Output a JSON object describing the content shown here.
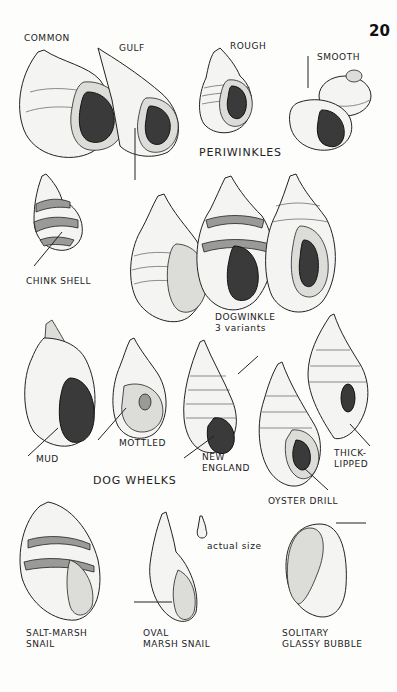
{
  "page": {
    "number": "20",
    "groups": {
      "periwinkles": "PERIWINKLES",
      "dogwinkle": "DOGWINKLE",
      "dogwinkle_note": "3 variants",
      "dog_whelks": "DOG WHELKS"
    },
    "labels": {
      "common": "COMMON",
      "gulf": "GULF",
      "rough": "ROUGH",
      "smooth": "SMOOTH",
      "chink_shell": "CHINK SHELL",
      "mud": "MUD",
      "mottled": "MOTTLED",
      "new_england_1": "NEW",
      "new_england_2": "ENGLAND",
      "thick_lipped_1": "THICK-",
      "thick_lipped_2": "LIPPED",
      "oyster_drill": "OYSTER DRILL",
      "salt_marsh_1": "SALT-MARSH",
      "salt_marsh_2": "SNAIL",
      "oval_marsh_1": "OVAL",
      "oval_marsh_2": "MARSH SNAIL",
      "solitary_1": "SOLITARY",
      "solitary_2": "GLASSY BUBBLE",
      "actual_size": "actual size"
    },
    "icons": [
      "common-periwinkle-illustration",
      "gulf-periwinkle-illustration",
      "rough-periwinkle-illustration",
      "smooth-periwinkle-illustration",
      "chink-shell-illustration",
      "dogwinkle-illustration",
      "mud-dog-whelk-illustration",
      "mottled-dog-whelk-illustration",
      "new-england-dog-whelk-illustration",
      "oyster-drill-illustration",
      "thick-lipped-drill-illustration",
      "salt-marsh-snail-illustration",
      "oval-marsh-snail-illustration",
      "actual-size-snail-icon",
      "solitary-glassy-bubble-illustration"
    ]
  }
}
